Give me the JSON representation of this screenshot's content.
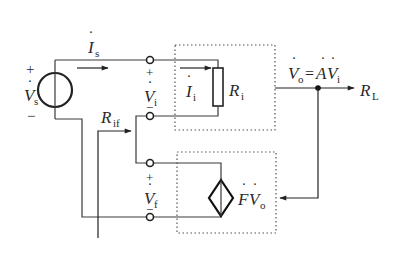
{
  "diagram": {
    "type": "feedback-amplifier-circuit",
    "source": {
      "symbol": "V",
      "subscript": "s",
      "plus": "+",
      "minus": "−"
    },
    "source_current": {
      "symbol": "I",
      "subscript": "s"
    },
    "input_voltage": {
      "symbol": "V",
      "subscript": "i",
      "plus": "+",
      "minus": "−"
    },
    "input_current": {
      "symbol": "I",
      "subscript": "i"
    },
    "input_resistor": {
      "symbol": "R",
      "subscript": "i"
    },
    "output_expr": {
      "left": "V",
      "left_sub": "o",
      "eq": "=",
      "gain": "A",
      "right": "V",
      "right_sub": "i"
    },
    "load": {
      "symbol": "R",
      "subscript": "L"
    },
    "feedback_resistance": {
      "symbol": "R",
      "subscript": "if"
    },
    "feedback_voltage": {
      "symbol": "V",
      "subscript": "f",
      "plus": "+",
      "minus": "−"
    },
    "feedback_source": {
      "factor": "F",
      "symbol": "V",
      "subscript": "o"
    }
  },
  "colors": {
    "line": "#3a3a3a",
    "text": "#2a2a2a",
    "dotted": "#555555"
  }
}
